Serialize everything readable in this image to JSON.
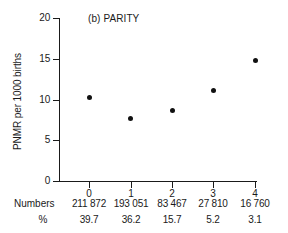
{
  "chart_data": {
    "type": "scatter",
    "title": "(b) PARITY",
    "xlabel": "",
    "ylabel": "PNMR per 1000 births",
    "categories": [
      "0",
      "1",
      "2",
      "3",
      "4"
    ],
    "x": [
      0,
      1,
      2,
      3,
      4
    ],
    "values": [
      10.2,
      7.7,
      8.7,
      11.1,
      14.8
    ],
    "ylim": [
      0,
      20
    ],
    "yticks": [
      0,
      5,
      10,
      15,
      20
    ],
    "ytick_labels": [
      "0",
      "5",
      "10",
      "15",
      "20"
    ],
    "xtick_labels": [
      "0",
      "1",
      "2",
      "3",
      "4"
    ],
    "grid": false,
    "legend": null,
    "marker": "filled-circle",
    "marker_color": "#111111",
    "axis_color": "#1a1a1a",
    "background": "#ffffff"
  },
  "table": {
    "rows": [
      {
        "header": "Numbers",
        "cells": [
          "211 872",
          "193 051",
          "83 467",
          "27 810",
          "16 760"
        ]
      },
      {
        "header": "%",
        "cells": [
          "39.7",
          "36.2",
          "15.7",
          "5.2",
          "3.1"
        ]
      }
    ]
  }
}
